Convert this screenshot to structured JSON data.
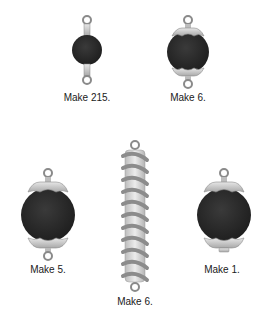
{
  "colors": {
    "bead": "#2b2b2b",
    "metal": "#c8c8c8",
    "metal_dark": "#8a8a8a",
    "coil": "#8c8c8c",
    "core": "#d9d9d9",
    "text": "#1a1a1a"
  },
  "components": [
    {
      "id": "small-bead-link",
      "label": "Make 215."
    },
    {
      "id": "capped-bead-link",
      "label": "Make 6."
    },
    {
      "id": "large-capped-bead-link",
      "label": "Make 5."
    },
    {
      "id": "spiral-tube-link",
      "label": "Make 6."
    },
    {
      "id": "large-capped-bead-dangle",
      "label": "Make 1."
    }
  ]
}
